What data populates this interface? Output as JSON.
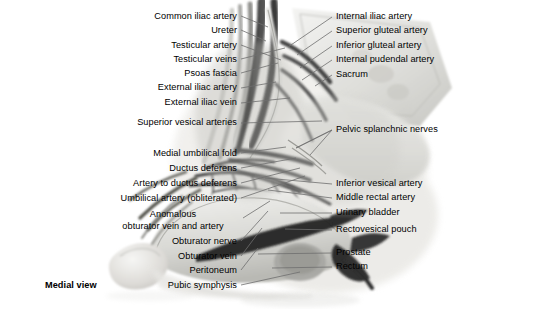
{
  "figure": {
    "view_note": "Medial view",
    "background_color": "#ffffff",
    "label_color": "#000000",
    "leader_color": "#6f6f6f"
  },
  "labels_left": [
    {
      "text": "Common iliac artery",
      "x": 237,
      "y": 18,
      "lx": 241,
      "ly": 16,
      "tx": 268,
      "ty": 27
    },
    {
      "text": "Ureter",
      "x": 237,
      "y": 32,
      "lx": 241,
      "ly": 30,
      "tx": 266,
      "ty": 41
    },
    {
      "text": "Testicular artery",
      "x": 237,
      "y": 47,
      "lx": 241,
      "ly": 45,
      "tx": 281,
      "ty": 60
    },
    {
      "text": "Testicular veins",
      "x": 237,
      "y": 61,
      "lx": 241,
      "ly": 59,
      "tx": 285,
      "ty": 48
    },
    {
      "text": "Psoas fascia",
      "x": 237,
      "y": 75,
      "lx": 241,
      "ly": 73,
      "tx": 278,
      "ty": 63
    },
    {
      "text": "External iliac artery",
      "x": 237,
      "y": 89,
      "lx": 241,
      "ly": 88,
      "tx": 276,
      "ty": 82
    },
    {
      "text": "External iliac vein",
      "x": 237,
      "y": 104,
      "lx": 241,
      "ly": 103,
      "tx": 290,
      "ty": 98
    },
    {
      "text": "Superior vesical arteries",
      "x": 237,
      "y": 124,
      "lx": 241,
      "ly": 123,
      "tx": 322,
      "ty": 121
    },
    {
      "text": "Medial umbilical fold",
      "x": 237,
      "y": 155,
      "lx": 241,
      "ly": 153,
      "tx": 286,
      "ty": 147
    },
    {
      "text": "Ductus deferens",
      "x": 237,
      "y": 170,
      "lx": 241,
      "ly": 168,
      "tx": 296,
      "ty": 158
    },
    {
      "text": "Artery to ductus deferens",
      "x": 237,
      "y": 185,
      "lx": 241,
      "ly": 183,
      "tx": 300,
      "ty": 168
    },
    {
      "text": "Umbilical artery (obliterated)",
      "x": 237,
      "y": 200,
      "lx": 241,
      "ly": 198,
      "tx": 305,
      "ty": 176
    }
  ],
  "labels_left_two_line": [
    {
      "line1": "Anomalous",
      "line2": "obturator vein and artery",
      "cx": 173,
      "y": 216,
      "lx": 243,
      "ly": 218,
      "tx": 270,
      "ty": 201
    }
  ],
  "labels_left_more": [
    {
      "text": "Obturator nerve",
      "x": 237,
      "y": 243,
      "lx": 241,
      "ly": 241,
      "tx": 268,
      "ty": 211
    },
    {
      "text": "Obturator vein",
      "x": 237,
      "y": 258,
      "lx": 241,
      "ly": 256,
      "tx": 262,
      "ty": 228
    },
    {
      "text": "Peritoneum",
      "x": 237,
      "y": 272,
      "lx": 241,
      "ly": 270,
      "tx": 258,
      "ty": 248
    },
    {
      "text": "Pubic symphysis",
      "x": 237,
      "y": 287,
      "lx": 241,
      "ly": 285,
      "tx": 300,
      "ty": 272
    }
  ],
  "labels_right": [
    {
      "text": "Internal iliac artery",
      "x": 336,
      "y": 18,
      "lx": 332,
      "ly": 17,
      "tx": 288,
      "ty": 47
    },
    {
      "text": "Superior gluteal artery",
      "x": 336,
      "y": 32,
      "lx": 332,
      "ly": 31,
      "tx": 297,
      "ty": 55
    },
    {
      "text": "Inferior gluteal artery",
      "x": 336,
      "y": 47,
      "lx": 332,
      "ly": 46,
      "tx": 300,
      "ty": 68
    },
    {
      "text": "Internal pudendal artery",
      "x": 336,
      "y": 61,
      "lx": 332,
      "ly": 60,
      "tx": 302,
      "ty": 80
    },
    {
      "text": "Sacrum",
      "x": 336,
      "y": 76,
      "lx": 332,
      "ly": 75,
      "tx": 315,
      "ty": 86
    },
    {
      "text": "Pelvic splanchnic nerves",
      "x": 336,
      "y": 131,
      "lx": 332,
      "ly": 130,
      "tx": 296,
      "ty": 148
    },
    {
      "text": "Inferior vesical artery",
      "x": 336,
      "y": 185,
      "lx": 332,
      "ly": 184,
      "tx": 265,
      "ty": 178
    },
    {
      "text": "Middle rectal artery",
      "x": 336,
      "y": 199,
      "lx": 332,
      "ly": 198,
      "tx": 268,
      "ty": 190
    },
    {
      "text": "Urinary bladder",
      "x": 336,
      "y": 214,
      "lx": 332,
      "ly": 213,
      "tx": 280,
      "ty": 213
    },
    {
      "text": "Rectovesical pouch",
      "x": 336,
      "y": 231,
      "lx": 332,
      "ly": 230,
      "tx": 285,
      "ty": 229
    },
    {
      "text": "Prostate",
      "x": 336,
      "y": 254,
      "lx": 332,
      "ly": 253,
      "tx": 258,
      "ty": 254
    },
    {
      "text": "Rectum",
      "x": 336,
      "y": 268,
      "lx": 332,
      "ly": 267,
      "tx": 272,
      "ty": 268
    }
  ],
  "splanchnic_fork": [
    {
      "tx": 296,
      "ty": 148
    },
    {
      "tx": 310,
      "ty": 155
    }
  ],
  "view_label": {
    "text": "Medial view",
    "x": 45,
    "y": 287
  }
}
